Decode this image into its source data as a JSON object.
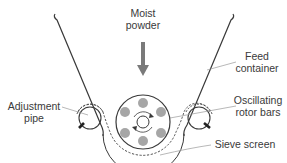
{
  "diagram": {
    "colors": {
      "line": "#3a3a3a",
      "leader": "#9a9a9a",
      "arrow": "#7a7a7a",
      "rotor_bar": "#a6a6a6",
      "background": "#ffffff"
    },
    "labels": {
      "moist_powder": {
        "line1": "Moist",
        "line2": "powder"
      },
      "feed_container": {
        "line1": "Feed",
        "line2": "container"
      },
      "oscillating_rotor_bars": {
        "line1": "Oscillating",
        "line2": "rotor bars"
      },
      "adjustment_pipe": {
        "line1": "Adjustment",
        "line2": "pipe"
      },
      "sieve_screen": {
        "line1": "Sieve screen"
      }
    },
    "components": [
      "feed-container",
      "moist-powder-arrow",
      "rotor",
      "rotor-bars",
      "adjustment-pipe-left",
      "adjustment-pipe-right",
      "sieve-screen"
    ]
  }
}
